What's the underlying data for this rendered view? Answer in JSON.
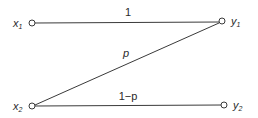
{
  "diagram": {
    "type": "binary channel (Z-channel)",
    "inputs": [
      {
        "id": "x1",
        "name": "x",
        "sub": "1"
      },
      {
        "id": "x2",
        "name": "x",
        "sub": "2"
      }
    ],
    "outputs": [
      {
        "id": "y1",
        "name": "y",
        "sub": "1"
      },
      {
        "id": "y2",
        "name": "y",
        "sub": "2"
      }
    ],
    "edges": [
      {
        "from": "x1",
        "to": "y1",
        "label": "1"
      },
      {
        "from": "x2",
        "to": "y1",
        "label": "p"
      },
      {
        "from": "x2",
        "to": "y2",
        "label": "1−p"
      }
    ]
  }
}
